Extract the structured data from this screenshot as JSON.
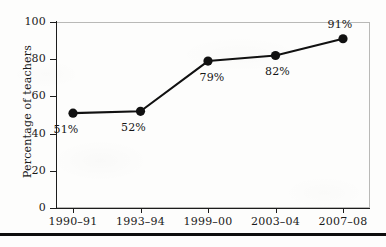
{
  "chart_data": {
    "type": "line",
    "title": "",
    "subtitle": "",
    "xlabel": "",
    "ylabel": "Percentage of teachers",
    "categories": [
      "1990–91",
      "1993–94",
      "1999–00",
      "2003–04",
      "2007–08"
    ],
    "values": [
      51,
      52,
      79,
      82,
      91
    ],
    "point_labels": [
      "51%",
      "52%",
      "79%",
      "82%",
      "91%"
    ],
    "ylim": [
      0,
      100
    ],
    "y_ticks": [
      0,
      20,
      40,
      60,
      80,
      100
    ],
    "y_tick_labels": [
      "0",
      "20",
      "40",
      "60",
      "80",
      "100"
    ],
    "grid": false,
    "legend": false,
    "legend_position": "none",
    "marker": "filled-circle",
    "line_color": "#111111",
    "marker_color": "#111111",
    "frame_color": "#b9b9b7",
    "text_color": "#1a1a1a",
    "background": "#fdfdfc"
  },
  "figure": {
    "bottom_rule_color": "#0d0d0d"
  }
}
